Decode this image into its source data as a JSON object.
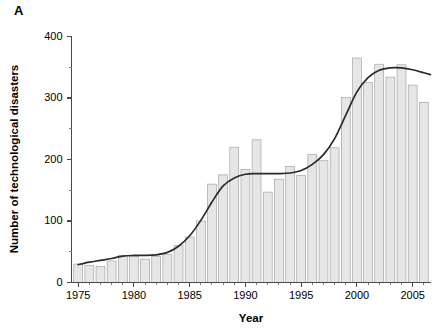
{
  "figure": {
    "panel_label": "A",
    "background_color": "#ffffff"
  },
  "style": {
    "bar_fill": "#e6e6e6",
    "bar_stroke": "#9a9a9a",
    "curve_color": "#2b2b2b",
    "axis_color": "#4a4a4a",
    "text_color": "#000000"
  },
  "chart_data": {
    "type": "bar",
    "title": "",
    "subtitle": "",
    "xlabel": "Year",
    "ylabel": "Number of technological disasters",
    "xlim": [
      1974.4,
      1975,
      2006.6
    ],
    "ylim": [
      0,
      400
    ],
    "xtick_labels": [
      "1975",
      "1980",
      "1985",
      "1990",
      "1995",
      "2000",
      "2005"
    ],
    "xticks": [
      1975,
      1980,
      1985,
      1990,
      1995,
      2000,
      2005
    ],
    "xticks_minor": [
      1976,
      1977,
      1978,
      1979,
      1981,
      1982,
      1983,
      1984,
      1986,
      1987,
      1988,
      1989,
      1991,
      1992,
      1993,
      1994,
      1996,
      1997,
      1998,
      1999,
      2001,
      2002,
      2003,
      2004,
      2006
    ],
    "ytick_labels": [
      "0",
      "100",
      "200",
      "300",
      "400"
    ],
    "yticks": [
      0,
      100,
      200,
      300,
      400
    ],
    "yticks_minor": [
      50,
      150,
      250,
      350
    ],
    "grid": false,
    "legend": null,
    "legend_position": "none",
    "categories": [
      1975,
      1976,
      1977,
      1978,
      1979,
      1980,
      1981,
      1982,
      1983,
      1984,
      1985,
      1986,
      1987,
      1988,
      1989,
      1990,
      1991,
      1992,
      1993,
      1994,
      1995,
      1996,
      1997,
      1998,
      1999,
      2000,
      2001,
      2002,
      2003,
      2004,
      2005,
      2006
    ],
    "values": [
      30,
      28,
      26,
      35,
      44,
      42,
      38,
      42,
      46,
      60,
      74,
      100,
      160,
      175,
      220,
      184,
      232,
      147,
      168,
      189,
      174,
      208,
      198,
      219,
      301,
      365,
      325,
      355,
      334,
      354,
      321,
      293
    ],
    "series": [
      {
        "name": "Number of technological disasters",
        "kind": "bar",
        "values": [
          30,
          28,
          26,
          35,
          44,
          42,
          38,
          42,
          46,
          60,
          74,
          100,
          160,
          175,
          220,
          184,
          232,
          147,
          168,
          189,
          174,
          208,
          198,
          219,
          301,
          365,
          325,
          355,
          334,
          354,
          321,
          293
        ]
      },
      {
        "name": "Smoothed trend",
        "kind": "line",
        "x": [
          1975,
          1976,
          1977,
          1978,
          1979,
          1980,
          1981,
          1982,
          1983,
          1984,
          1985,
          1986,
          1987,
          1988,
          1989,
          1990,
          1991,
          1992,
          1993,
          1994,
          1995,
          1996,
          1997,
          1998,
          1999,
          2000,
          2001,
          2002,
          2003,
          2004,
          2005,
          2006,
          2006.6
        ],
        "values": [
          29,
          33,
          36,
          39,
          43,
          44,
          44,
          45,
          49,
          59,
          76,
          101,
          131,
          157,
          170,
          176,
          177,
          177,
          177,
          178,
          182,
          192,
          208,
          234,
          272,
          310,
          333,
          345,
          349,
          349,
          346,
          341,
          338
        ]
      }
    ]
  }
}
